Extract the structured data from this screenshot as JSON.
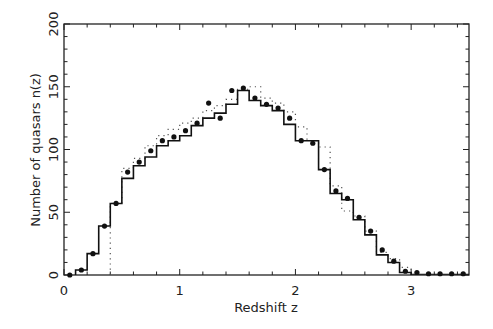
{
  "chart_data": {
    "type": "bar",
    "title": "",
    "xlabel": "Redshift z",
    "ylabel": "Number of quasars n(z)",
    "xlim": [
      0,
      3.5
    ],
    "ylim": [
      0,
      200
    ],
    "xticks": [
      0,
      1,
      2,
      3
    ],
    "xtick_labels": [
      "0",
      "1",
      "2",
      "3"
    ],
    "yticks": [
      0,
      50,
      100,
      150,
      200
    ],
    "ytick_labels": [
      "0",
      "50",
      "100",
      "150",
      "200"
    ],
    "x_minor_step": 0.2,
    "y_minor_step": 10,
    "grid": false,
    "legend": null,
    "series": [
      {
        "name": "observed histogram",
        "style": "solid-step",
        "bin_edges": [
          0.1,
          0.2,
          0.3,
          0.4,
          0.5,
          0.6,
          0.7,
          0.8,
          0.9,
          1.0,
          1.1,
          1.2,
          1.3,
          1.4,
          1.5,
          1.6,
          1.7,
          1.8,
          1.9,
          2.0,
          2.2,
          2.3,
          2.4,
          2.5,
          2.6,
          2.7,
          2.8,
          2.9,
          3.0
        ],
        "values": [
          4,
          17,
          39,
          57,
          77,
          87,
          94,
          103,
          107,
          111,
          119,
          125,
          129,
          136,
          147,
          139,
          135,
          131,
          120,
          107,
          84,
          65,
          60,
          44,
          32,
          16,
          10,
          2
        ]
      },
      {
        "name": "model points",
        "style": "filled-dots",
        "x": [
          0.05,
          0.15,
          0.25,
          0.35,
          0.45,
          0.55,
          0.65,
          0.75,
          0.85,
          0.95,
          1.05,
          1.15,
          1.25,
          1.35,
          1.45,
          1.55,
          1.65,
          1.75,
          1.85,
          1.95,
          2.05,
          2.15,
          2.25,
          2.35,
          2.45,
          2.55,
          2.65,
          2.75,
          2.85,
          2.95,
          3.05,
          3.15,
          3.25,
          3.35,
          3.45
        ],
        "y": [
          0,
          4,
          17,
          39,
          57,
          82,
          90,
          99,
          107,
          110,
          115,
          121,
          137,
          125,
          147,
          149,
          141,
          136,
          133,
          125,
          107,
          105,
          84,
          67,
          61,
          46,
          35,
          20,
          11,
          3,
          2,
          1,
          1,
          1,
          1
        ]
      },
      {
        "name": "alternate model",
        "style": "dotted-step",
        "bin_edges": [
          0.4,
          0.5,
          0.6,
          0.7,
          0.8,
          0.9,
          1.0,
          1.1,
          1.2,
          1.3,
          1.4,
          1.5,
          1.6,
          1.7,
          1.8,
          1.9,
          2.0,
          2.1,
          2.2,
          2.3,
          2.4,
          2.5,
          2.6,
          2.7,
          2.8,
          2.9,
          3.0
        ],
        "values": [
          57,
          85,
          93,
          103,
          111,
          116,
          121,
          125,
          131,
          135,
          140,
          148,
          150,
          141,
          137,
          130,
          118,
          107,
          102,
          71,
          51,
          47,
          35,
          18,
          13,
          6,
          2
        ]
      }
    ]
  }
}
